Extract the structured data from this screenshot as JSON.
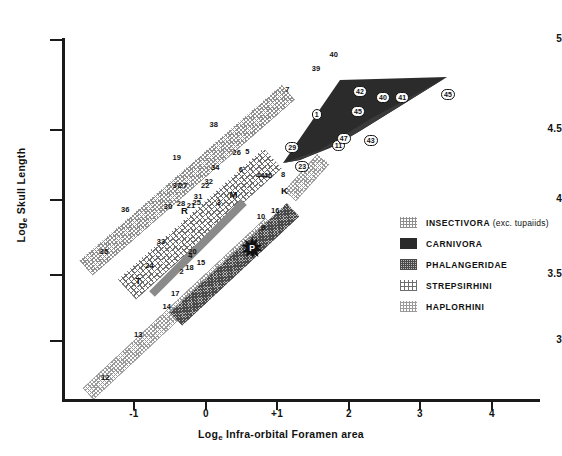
{
  "chart_data": {
    "type": "scatter",
    "title": "",
    "xlabel": "Log_e Infra-orbital Foramen area",
    "ylabel": "Log_e Skull Length",
    "xlim": [
      -1.6,
      4.0
    ],
    "ylim": [
      2.6,
      5.05
    ],
    "xticks": [
      "-1",
      "0",
      "+1",
      "2",
      "3",
      "4"
    ],
    "yticks": [
      "3",
      "3.5",
      "4",
      "4.5",
      "5"
    ],
    "grid": false,
    "legend_position": "right-middle",
    "legend": [
      {
        "key": "insectivora",
        "label": "INSECTIVORA",
        "suffix": "(exc. tupaiids)",
        "swatch": "light-dotted"
      },
      {
        "key": "carnivora",
        "label": "CARNIVORA",
        "suffix": "",
        "swatch": "solid-dark"
      },
      {
        "key": "phalangeridae",
        "label": "PHALANGERIDAE",
        "suffix": "",
        "swatch": "dense-crosshatch"
      },
      {
        "key": "strepsirhini",
        "label": "STREPSIRHINI",
        "suffix": "",
        "swatch": "sparse-dots"
      },
      {
        "key": "haplorhini",
        "label": "HAPLORHINI",
        "suffix": "",
        "swatch": "fine-dots"
      }
    ],
    "series": [
      {
        "name": "INSECTIVORA (exc. tupaiids)",
        "points": [
          {
            "label": "35",
            "x": -1.42,
            "y": 3.63
          },
          {
            "label": "36",
            "x": -1.12,
            "y": 3.93
          },
          {
            "label": "19",
            "x": -0.4,
            "y": 4.3
          },
          {
            "label": "38",
            "x": 0.12,
            "y": 4.53
          },
          {
            "label": "7",
            "x": 1.18,
            "y": 4.78
          },
          {
            "label": "39",
            "x": 1.55,
            "y": 4.93
          },
          {
            "label": "40",
            "x": 1.8,
            "y": 5.03
          }
        ]
      },
      {
        "name": "STREPSIRHINI",
        "points": [
          {
            "label": "24",
            "x": -0.78,
            "y": 3.53
          },
          {
            "label": "33",
            "x": -0.62,
            "y": 3.7
          },
          {
            "label": "30",
            "x": -0.52,
            "y": 3.95
          },
          {
            "label": "28",
            "x": -0.34,
            "y": 3.97
          },
          {
            "label": "R",
            "x": -0.28,
            "y": 3.93
          },
          {
            "label": "21",
            "x": -0.2,
            "y": 3.96
          },
          {
            "label": "25",
            "x": -0.12,
            "y": 3.98
          },
          {
            "label": "37",
            "x": -0.4,
            "y": 4.1
          },
          {
            "label": "27",
            "x": -0.31,
            "y": 4.1
          },
          {
            "label": "31",
            "x": -0.1,
            "y": 4.02
          },
          {
            "label": "22",
            "x": 0.0,
            "y": 4.1
          },
          {
            "label": "32",
            "x": 0.05,
            "y": 4.13
          },
          {
            "label": "34",
            "x": 0.14,
            "y": 4.23
          },
          {
            "label": "26",
            "x": 0.44,
            "y": 4.33
          },
          {
            "label": "T",
            "x": -0.92,
            "y": 3.43
          }
        ]
      },
      {
        "name": "PHALANGERIDAE",
        "points": [
          {
            "label": "2",
            "x": -0.3,
            "y": 3.49
          },
          {
            "label": "4",
            "x": -0.18,
            "y": 3.6
          },
          {
            "label": "3",
            "x": 0.22,
            "y": 3.98
          },
          {
            "label": "M",
            "x": 0.4,
            "y": 4.04
          },
          {
            "label": "6",
            "x": 0.53,
            "y": 4.21
          },
          {
            "label": "5",
            "x": 0.62,
            "y": 4.34
          }
        ]
      },
      {
        "name": "HAPLORHINI",
        "points": [
          {
            "label": "12",
            "x": -1.4,
            "y": 2.74
          },
          {
            "label": "13",
            "x": -0.94,
            "y": 3.04
          },
          {
            "label": "14",
            "x": -0.54,
            "y": 3.24
          },
          {
            "label": "17",
            "x": -0.42,
            "y": 3.33
          },
          {
            "label": "18",
            "x": -0.22,
            "y": 3.52
          },
          {
            "label": "15",
            "x": -0.06,
            "y": 3.55
          },
          {
            "label": "20",
            "x": -0.18,
            "y": 3.63
          },
          {
            "label": "9",
            "x": 0.84,
            "y": 3.8
          },
          {
            "label": "10",
            "x": 0.78,
            "y": 3.88
          },
          {
            "label": "16",
            "x": 0.98,
            "y": 3.92
          },
          {
            "label": "K",
            "x": 1.12,
            "y": 4.07
          },
          {
            "label": "8",
            "x": 1.12,
            "y": 4.18
          },
          {
            "label": "44",
            "x": 0.77,
            "y": 4.17
          },
          {
            "label": "46",
            "x": 0.88,
            "y": 4.17
          }
        ]
      },
      {
        "name": "CARNIVORA",
        "points": [
          {
            "label": "23",
            "x": 1.32,
            "y": 4.25
          },
          {
            "label": "29",
            "x": 1.18,
            "y": 4.38
          },
          {
            "label": "1",
            "x": 1.55,
            "y": 4.62
          },
          {
            "label": "11",
            "x": 1.83,
            "y": 4.4
          },
          {
            "label": "47",
            "x": 1.9,
            "y": 4.45
          },
          {
            "label": "43",
            "x": 2.28,
            "y": 4.43
          },
          {
            "label": "45",
            "x": 2.1,
            "y": 4.64
          },
          {
            "label": "42",
            "x": 2.13,
            "y": 4.78
          },
          {
            "label": "40",
            "x": 2.45,
            "y": 4.74
          },
          {
            "label": "41",
            "x": 2.72,
            "y": 4.74
          },
          {
            "label": "45",
            "x": 3.36,
            "y": 4.76
          }
        ]
      }
    ],
    "special_marker": {
      "label": "P",
      "shape": "star",
      "x": 0.66,
      "y": 3.66
    }
  },
  "axes": {
    "y_title": "Log",
    "y_title_sub": "e",
    "y_title_rest": " Skull Length",
    "x_title": "Log",
    "x_title_sub": "e",
    "x_title_rest": " Infra-orbital Foramen area"
  }
}
